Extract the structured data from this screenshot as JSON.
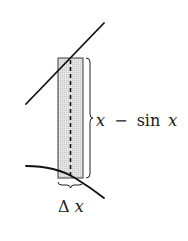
{
  "diagram": {
    "type": "area-strip-between-curves",
    "upper_curve": {
      "name": "y = x",
      "color": "#111111"
    },
    "lower_curve": {
      "name": "y = sin x",
      "color": "#111111"
    },
    "strip": {
      "fill": "#dcdcdc",
      "stroke": "#333333"
    },
    "height_label": {
      "var1": "x",
      "op": "−",
      "func": "sin",
      "var2": "x"
    },
    "width_label": {
      "delta": "Δ",
      "var": "x"
    }
  }
}
